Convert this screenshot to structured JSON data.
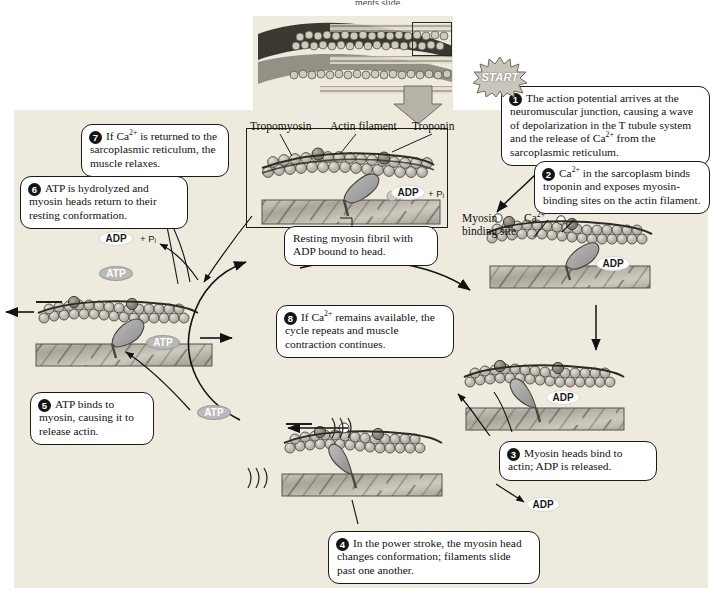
{
  "figure": {
    "title_cropped": "ments slide.",
    "start_badge": "START"
  },
  "inset": {
    "label_tropomyosin": "Tropomyosin",
    "label_actin_filament": "Actin filament",
    "label_troponin": "Troponin",
    "caption": "Resting myosin fibril with ADP bound to head.",
    "adp": "ADP",
    "pi": "+ Pᵢ"
  },
  "labels": {
    "myosin_binding_site": "Myosin\nbinding site",
    "myosin_binding_site_line1": "Myosin",
    "myosin_binding_site_line2": "binding site",
    "calcium": "Ca",
    "calcium_charge": "2+"
  },
  "nucleotides": {
    "adp": "ADP",
    "atp": "ATP",
    "pi": "+ Pᵢ"
  },
  "steps": [
    {
      "number": "1",
      "text": "The action potential arrives at the neuromuscular junction, causing a wave of depolarization in the T tubule system and the release of Ca2+ from the sarcoplasmic reticulum.",
      "html": "The action potential arrives at the neuromuscular junction, causing a wave of depolarization in the T tubule system and the release of Ca<sup>2+</sup> from the sarcoplasmic reticulum."
    },
    {
      "number": "2",
      "text": "Ca2+ in the sarcoplasm binds troponin and exposes myosin-binding sites on the actin filament.",
      "html": "Ca<sup>2+</sup> in the sarcoplasm binds troponin and exposes myosin-binding sites on the actin filament."
    },
    {
      "number": "3",
      "text": "Myosin heads bind to actin; ADP is released.",
      "html": "Myosin heads bind to actin; ADP is released."
    },
    {
      "number": "4",
      "text": "In the power stroke, the myosin head changes conformation; filaments slide past one another.",
      "html": "In the power stroke, the myosin head changes conformation; filaments slide past one another."
    },
    {
      "number": "5",
      "text": "ATP binds to myosin, causing it to release actin.",
      "html": "ATP binds to myosin, causing it to release actin."
    },
    {
      "number": "6",
      "text": "ATP is hydrolyzed and myosin heads return to their resting conformation.",
      "html": "ATP is hydrolyzed and myosin heads return to their resting conformation."
    },
    {
      "number": "7",
      "text": "If Ca2+ is returned to the sarcoplasmic reticulum, the muscle relaxes.",
      "html": "If Ca<sup>2+</sup> is returned to the sarcoplasmic reticulum, the muscle relaxes."
    },
    {
      "number": "8",
      "text": "If Ca2+ remains available, the cycle repeats and muscle contraction continues.",
      "html": "If Ca<sup>2+</sup> remains available, the cycle repeats and muscle contraction continues."
    }
  ],
  "colors": {
    "background_panel": "#eeeade",
    "outline": "#1a1a1a",
    "callout_fill": "#ffffff",
    "myosin_head": "#9c9c9c",
    "actin_bead": "#c9c6bc",
    "thick_filament": "#b0aca1",
    "atp_pill": "#b9b9b9"
  }
}
